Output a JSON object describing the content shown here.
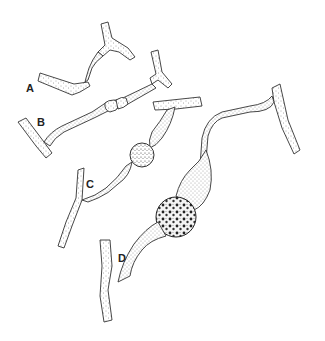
{
  "figure": {
    "type": "biological illustration",
    "labels": {
      "a": "A",
      "b": "B",
      "c": "C",
      "d": "D"
    },
    "stages": [
      {
        "label": "A",
        "description": "two hyphal branches making contact"
      },
      {
        "label": "B",
        "description": "fused gametangia with septa forming"
      },
      {
        "label": "C",
        "description": "young zygospore swelling between suspensors"
      },
      {
        "label": "D",
        "description": "mature warty zygospore between suspensors"
      }
    ],
    "colors": {
      "background": "#ffffff",
      "ink": "#333333"
    }
  }
}
